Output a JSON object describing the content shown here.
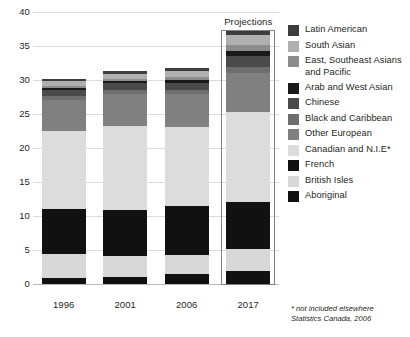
{
  "chart_data": {
    "type": "bar",
    "subtype": "stacked",
    "title": "",
    "xlabel": "",
    "ylabel": "",
    "ylim": [
      0,
      40
    ],
    "yticks": [
      0,
      5,
      10,
      15,
      20,
      25,
      30,
      35,
      40
    ],
    "ytick_labels": [
      "0",
      "5",
      "10",
      "15",
      "20",
      "25",
      "30",
      "35",
      "40"
    ],
    "grid": true,
    "legend_position": "right",
    "categories": [
      "1996",
      "2001",
      "2006",
      "2017"
    ],
    "series": [
      {
        "name": "Aboriginal",
        "color": "#111111",
        "values": [
          0.9,
          1.1,
          1.5,
          1.9
        ]
      },
      {
        "name": "British Isles",
        "color": "#d8d8d8",
        "values": [
          3.5,
          3.0,
          2.7,
          3.3
        ]
      },
      {
        "name": "French",
        "color": "#111111",
        "values": [
          6.7,
          6.8,
          7.3,
          6.9
        ]
      },
      {
        "name": "Canadian and N.I.E*",
        "color": "#dcdcdc",
        "values": [
          11.4,
          12.3,
          11.6,
          13.2
        ]
      },
      {
        "name": "Other European",
        "color": "#808080",
        "values": [
          4.5,
          4.7,
          4.8,
          5.7
        ]
      },
      {
        "name": "Black and Caribbean",
        "color": "#6e6e6e",
        "values": [
          0.6,
          0.6,
          0.6,
          0.9
        ]
      },
      {
        "name": "Chinese",
        "color": "#4a4a4a",
        "values": [
          0.9,
          1.0,
          1.1,
          1.7
        ]
      },
      {
        "name": "Arab and West Asian",
        "color": "#1a1a1a",
        "values": [
          0.3,
          0.3,
          0.4,
          0.7
        ]
      },
      {
        "name": "East, Southeast Asians and Pacific",
        "color": "#8c8c8c",
        "values": [
          0.4,
          0.4,
          0.5,
          0.8
        ]
      },
      {
        "name": "South Asian",
        "color": "#b0b0b0",
        "values": [
          0.6,
          0.7,
          0.9,
          1.5
        ]
      },
      {
        "name": "Latin American",
        "color": "#3d3d3d",
        "values": [
          0.3,
          0.4,
          0.4,
          0.6
        ]
      }
    ],
    "totals": [
      29.2,
      30.3,
      31.1,
      36.4
    ],
    "annotations": [
      {
        "name": "projections",
        "text": "Projections",
        "applies_to": "2017"
      }
    ],
    "footnote": "* not included elsewhere\nStatistics Canada, 2006"
  },
  "legend": {
    "items": [
      {
        "label": "Latin American",
        "color": "#3d3d3d"
      },
      {
        "label": "South Asian",
        "color": "#b0b0b0"
      },
      {
        "label": "East, Southeast Asians and Pacific",
        "color": "#8c8c8c"
      },
      {
        "label": "Arab and West Asian",
        "color": "#1a1a1a"
      },
      {
        "label": "Chinese",
        "color": "#4a4a4a"
      },
      {
        "label": "Black and Caribbean",
        "color": "#6e6e6e"
      },
      {
        "label": "Other European",
        "color": "#808080"
      },
      {
        "label": "Canadian and N.I.E*",
        "color": "#dcdcdc"
      },
      {
        "label": "French",
        "color": "#111111"
      },
      {
        "label": "British Isles",
        "color": "#d8d8d8"
      },
      {
        "label": "Aboriginal",
        "color": "#111111"
      }
    ]
  },
  "annotation": {
    "projections_label": "Projections"
  },
  "footnote": {
    "line1": "* not included elsewhere",
    "line2": "Statistics Canada, 2006"
  },
  "colors": {
    "gridline": "#dcdcdc",
    "axis": "#b9b9b9",
    "text": "#231f20",
    "projection_border": "#808080"
  }
}
